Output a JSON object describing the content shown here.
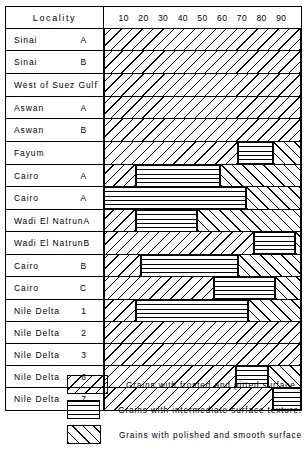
{
  "figure": {
    "header": {
      "locality_label": "Locality",
      "axis_ticks": [
        "10",
        "20",
        "30",
        "40",
        "50",
        "60",
        "70",
        "80",
        "90"
      ]
    }
  },
  "legend": {
    "items": [
      {
        "pattern": "frosted",
        "text": "Grains with frosted and pitted surface ."
      },
      {
        "pattern": "intermediate",
        "text": "Grains with intermediate surface texture."
      },
      {
        "pattern": "polished",
        "text": "Grains with polished and smooth surface"
      }
    ]
  },
  "chart_data": {
    "type": "bar",
    "subtype": "100% stacked horizontal bar",
    "title": "",
    "xlabel": "",
    "ylabel": "Locality",
    "xlim": [
      0,
      100
    ],
    "xticks": [
      10,
      20,
      30,
      40,
      50,
      60,
      70,
      80,
      90
    ],
    "grid": false,
    "legend_position": "below",
    "series": [
      {
        "name": "Grains with frosted and pitted surface .",
        "key": "frosted"
      },
      {
        "name": "Grains with intermediate surface texture.",
        "key": "intermediate"
      },
      {
        "name": "Grains with polished and smooth surface",
        "key": "polished"
      }
    ],
    "groups": [
      {
        "rows": [
          {
            "label": "Sinai",
            "num": "A",
            "frosted": 100,
            "intermediate": 0,
            "polished": 0
          },
          {
            "label": "Sinai",
            "num": "B",
            "frosted": 100,
            "intermediate": 0,
            "polished": 0
          }
        ]
      },
      {
        "rows": [
          {
            "label": "West of Suez Gulf",
            "num": "",
            "frosted": 100,
            "intermediate": 0,
            "polished": 0
          }
        ]
      },
      {
        "rows": [
          {
            "label": "Aswan",
            "num": "A",
            "frosted": 100,
            "intermediate": 0,
            "polished": 0
          },
          {
            "label": "Aswan",
            "num": "B",
            "frosted": 100,
            "intermediate": 0,
            "polished": 0
          }
        ]
      },
      {
        "rows": [
          {
            "label": "Fayum",
            "num": "",
            "frosted": 68,
            "intermediate": 18,
            "polished": 14
          }
        ]
      },
      {
        "rows": [
          {
            "label": "Cairo",
            "num": "A",
            "frosted": 16,
            "intermediate": 43,
            "polished": 41
          },
          {
            "label": "Cairo",
            "num": "A",
            "frosted": 0,
            "intermediate": 72,
            "polished": 28
          }
        ]
      },
      {
        "rows": [
          {
            "label": "Wadi El Natrun",
            "num": "A",
            "frosted": 16,
            "intermediate": 31,
            "polished": 53
          },
          {
            "label": "Wadi El Natrun",
            "num": "B",
            "frosted": 76,
            "intermediate": 21,
            "polished": 3
          }
        ]
      },
      {
        "rows": [
          {
            "label": "Cairo",
            "num": "B",
            "frosted": 19,
            "intermediate": 49,
            "polished": 32
          },
          {
            "label": "Cairo",
            "num": "C",
            "frosted": 56,
            "intermediate": 31,
            "polished": 13
          }
        ]
      },
      {
        "rows": [
          {
            "label": "Nile Delta",
            "num": "1",
            "frosted": 16,
            "intermediate": 57,
            "polished": 27
          },
          {
            "label": "Nile Delta",
            "num": "2",
            "frosted": 100,
            "intermediate": 0,
            "polished": 0
          },
          {
            "label": "Nile Delta",
            "num": "3",
            "frosted": 100,
            "intermediate": 0,
            "polished": 0
          },
          {
            "label": "Nile Delta",
            "num": "6",
            "frosted": 67,
            "intermediate": 16,
            "polished": 17
          },
          {
            "label": "Nile Delta",
            "num": "7",
            "frosted": 86,
            "intermediate": 14,
            "polished": 0
          }
        ]
      }
    ]
  }
}
